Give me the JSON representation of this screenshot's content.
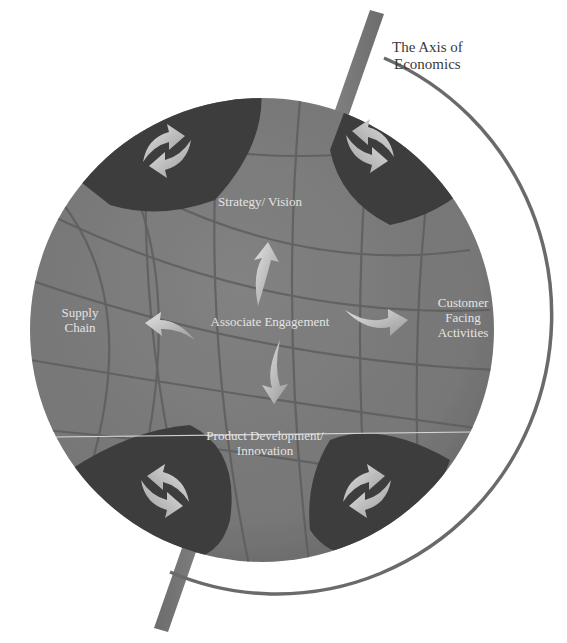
{
  "diagram": {
    "title": "The Axis of Economics",
    "axis_label_line1": "The Axis of",
    "axis_label_line2": "Economics",
    "center": "Associate Engagement",
    "nodes": {
      "top": "Strategy/ Vision",
      "left_line1": "Supply",
      "left_line2": "Chain",
      "right_line1": "Customer",
      "right_line2": "Facing",
      "right_line3": "Activities",
      "bottom_line1": "Product Development/",
      "bottom_line2": "Innovation"
    },
    "corner_icons": [
      "cycle-arrows",
      "cycle-arrows",
      "cycle-arrows",
      "cycle-arrows"
    ],
    "colors": {
      "globe": "#7a7a7a",
      "grid": "#5e5e5e",
      "corner_caps": "#3c3c3c",
      "arrows": "#c8c8c8",
      "axis_bar": "#7d7d7d",
      "orbit_ring": "#6a6a6a",
      "label_text": "#e4e4e4",
      "axis_text": "#3a3a3a"
    }
  }
}
